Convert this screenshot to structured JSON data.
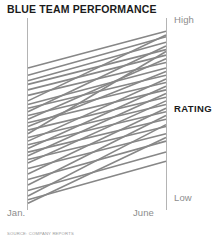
{
  "chart": {
    "title": "BLUE TEAM PERFORMANCE",
    "source_note": "SOURCE: COMPANY REPORTS",
    "rating_axis_label": "RATING",
    "top_label": "High",
    "bottom_label": "Low",
    "left_tick": "Jan.",
    "right_tick": "June",
    "line_color": "#878787",
    "axis_color": "#b4b4b4",
    "title_color": "#1b1b1b",
    "tick_color": "#8d8d8d"
  },
  "chart_data": {
    "type": "line",
    "title": "BLUE TEAM PERFORMANCE",
    "subtitle": "",
    "xlabel": "",
    "ylabel": "RATING",
    "grid": false,
    "legend": false,
    "categories": [
      "Jan.",
      "June"
    ],
    "x": [
      0,
      1
    ],
    "ylim": [
      0,
      100
    ],
    "ytick_labels": [
      "Low",
      "High"
    ],
    "ytick_values": [
      0,
      100
    ],
    "annotations": [
      "High",
      "Low",
      "RATING",
      "Jan.",
      "June"
    ],
    "series": [
      {
        "name": "member-01",
        "values": [
          76,
          96
        ]
      },
      {
        "name": "member-02",
        "values": [
          72,
          93
        ]
      },
      {
        "name": "member-03",
        "values": [
          69,
          90
        ]
      },
      {
        "name": "member-04",
        "values": [
          67,
          86
        ]
      },
      {
        "name": "member-05",
        "values": [
          64,
          83
        ]
      },
      {
        "name": "member-06",
        "values": [
          61,
          79
        ]
      },
      {
        "name": "member-07",
        "values": [
          58,
          94
        ]
      },
      {
        "name": "member-08",
        "values": [
          56,
          76
        ]
      },
      {
        "name": "member-09",
        "values": [
          54,
          72
        ]
      },
      {
        "name": "member-10",
        "values": [
          52,
          88
        ]
      },
      {
        "name": "member-11",
        "values": [
          50,
          68
        ]
      },
      {
        "name": "member-12",
        "values": [
          48,
          81
        ]
      },
      {
        "name": "member-13",
        "values": [
          46,
          64
        ]
      },
      {
        "name": "member-14",
        "values": [
          44,
          74
        ]
      },
      {
        "name": "member-15",
        "values": [
          42,
          60
        ]
      },
      {
        "name": "member-16",
        "values": [
          40,
          85
        ]
      },
      {
        "name": "member-17",
        "values": [
          38,
          56
        ]
      },
      {
        "name": "member-18",
        "values": [
          36,
          70
        ]
      },
      {
        "name": "member-19",
        "values": [
          34,
          52
        ]
      },
      {
        "name": "member-20",
        "values": [
          32,
          66
        ]
      },
      {
        "name": "member-21",
        "values": [
          30,
          48
        ]
      },
      {
        "name": "member-22",
        "values": [
          28,
          62
        ]
      },
      {
        "name": "member-23",
        "values": [
          26,
          44
        ]
      },
      {
        "name": "member-24",
        "values": [
          24,
          58
        ]
      },
      {
        "name": "member-25",
        "values": [
          21,
          40
        ]
      },
      {
        "name": "member-26",
        "values": [
          18,
          54
        ]
      },
      {
        "name": "member-27",
        "values": [
          15,
          36
        ]
      },
      {
        "name": "member-28",
        "values": [
          12,
          50
        ]
      },
      {
        "name": "member-29",
        "values": [
          9,
          30
        ]
      },
      {
        "name": "member-30",
        "values": [
          6,
          45
        ]
      },
      {
        "name": "member-31",
        "values": [
          4,
          25
        ]
      },
      {
        "name": "member-32",
        "values": [
          2,
          38
        ]
      }
    ]
  }
}
